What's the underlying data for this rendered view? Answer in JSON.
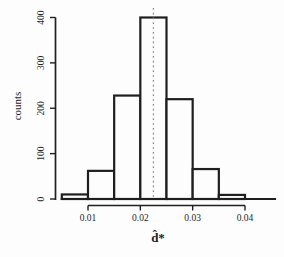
{
  "figure": {
    "background": "#fdfdfd",
    "ink_color": "#1f1f1f",
    "bar_fill": "#fdfdfd",
    "dotted_line_color": "#8a8a8a"
  },
  "chart_data": {
    "type": "bar",
    "subtype": "histogram",
    "xlabel": "d̂*",
    "ylabel": "counts",
    "bin_edges": [
      0.005,
      0.01,
      0.015,
      0.02,
      0.025,
      0.03,
      0.035,
      0.04
    ],
    "counts": [
      10,
      62,
      228,
      400,
      220,
      66,
      9
    ],
    "x_ticks": [
      {
        "value": 0.01,
        "label": "0.01"
      },
      {
        "value": 0.02,
        "label": "0.02"
      },
      {
        "value": 0.03,
        "label": "0.03"
      },
      {
        "value": 0.04,
        "label": "0.04"
      }
    ],
    "y_ticks": [
      {
        "value": 0,
        "label": "0"
      },
      {
        "value": 100,
        "label": "100"
      },
      {
        "value": 200,
        "label": "200"
      },
      {
        "value": 300,
        "label": "300"
      },
      {
        "value": 400,
        "label": "400"
      }
    ],
    "xlim": [
      0.005,
      0.045
    ],
    "ylim": [
      0,
      400
    ],
    "grid": false,
    "vline": {
      "x": 0.0225,
      "style": "dotted"
    }
  }
}
